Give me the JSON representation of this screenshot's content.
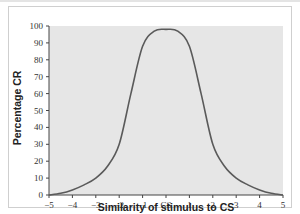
{
  "chart_data": {
    "type": "line",
    "title": "",
    "xlabel": "Similarity of stimulus to CS",
    "ylabel": "Percentage CR",
    "xlim": [
      -5,
      5
    ],
    "ylim": [
      0,
      100
    ],
    "x_tick_labels": [
      "−5",
      "−4",
      "−3",
      "−2",
      "−1",
      "CS",
      "1",
      "2",
      "3",
      "4",
      "5"
    ],
    "y_tick_labels": [
      "0",
      "10",
      "20",
      "30",
      "40",
      "50",
      "60",
      "70",
      "80",
      "90",
      "100"
    ],
    "grid": false,
    "legend": null,
    "series": [
      {
        "name": "Generalization gradient",
        "x": [
          -5,
          -4.5,
          -4,
          -3.5,
          -3,
          -2.5,
          -2,
          -1.5,
          -1,
          -0.5,
          0,
          0.5,
          1,
          1.5,
          2,
          2.5,
          3,
          3.5,
          4,
          4.5,
          5
        ],
        "values": [
          0,
          1,
          3,
          6,
          10,
          17,
          30,
          60,
          88,
          97,
          98,
          97,
          88,
          60,
          30,
          17,
          10,
          6,
          3,
          1,
          0
        ]
      }
    ],
    "colors": {
      "line": "#5a5a5a",
      "plot_background": "#e6e6e6",
      "axis": "#444444"
    }
  }
}
